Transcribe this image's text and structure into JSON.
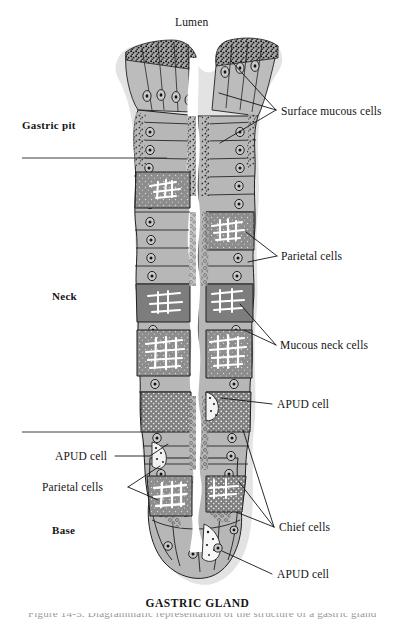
{
  "figure": {
    "title": "GASTRIC GLAND",
    "top_label": "Lumen",
    "caption_partial": "Figure  14-5.   Diagrammatic  representation  of  the  structure  of  a  gastric  gland",
    "regions": [
      {
        "name": "Gastric pit",
        "label": "Gastric pit"
      },
      {
        "name": "Neck",
        "label": "Neck"
      },
      {
        "name": "Base",
        "label": "Base"
      }
    ],
    "callouts": [
      {
        "id": "surface-mucous-cells",
        "label": "Surface mucous cells",
        "side": "right"
      },
      {
        "id": "parietal-cells-right",
        "label": "Parietal cells",
        "side": "right"
      },
      {
        "id": "mucous-neck-cells",
        "label": "Mucous neck cells",
        "side": "right"
      },
      {
        "id": "apud-cell-neck",
        "label": "APUD cell",
        "side": "right"
      },
      {
        "id": "apud-cell-left",
        "label": "APUD cell",
        "side": "left"
      },
      {
        "id": "parietal-cells-left",
        "label": "Parietal  cells",
        "side": "left"
      },
      {
        "id": "chief-cells",
        "label": "Chief cells",
        "side": "right"
      },
      {
        "id": "apud-cell-base",
        "label": "APUD cell",
        "side": "right"
      }
    ],
    "colors": {
      "ink": "#141414",
      "cell_fill": "#b9b9b9",
      "dark_cell_fill": "#8a8a8a",
      "halo": "#d6d6d6",
      "lumen": "#ffffff",
      "background": "#ffffff",
      "divider": "#4a4a4a"
    }
  }
}
